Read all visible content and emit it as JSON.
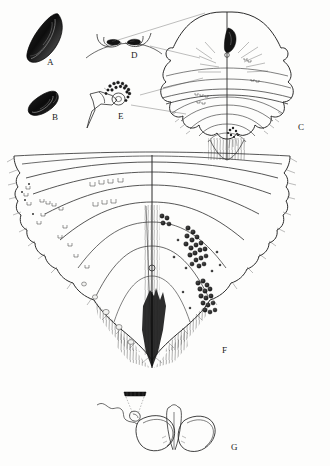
{
  "figure": {
    "background_color": "#fdfdfc",
    "ink_color": "#2b2b2b",
    "panels": [
      {
        "id": "A",
        "label": "A",
        "label_x": 47,
        "label_y": 63,
        "description": "dark elongate sclerotized body, oblique, whole specimen lateral",
        "kind": "solid-dark-elongate"
      },
      {
        "id": "B",
        "label": "B",
        "label_x": 52,
        "label_y": 118,
        "description": "smaller dark elongate body, oblique, whole specimen",
        "kind": "solid-dark-elongate"
      },
      {
        "id": "C",
        "label": "C",
        "label_x": 298,
        "label_y": 128,
        "description": "dorsal view of body with median line, lobed margins and radiating striations",
        "kind": "outline-body-dorsal"
      },
      {
        "id": "D",
        "label": "D",
        "label_x": 131,
        "label_y": 56,
        "description": "paired hook-like marginal structures on cuticle arc, enlarged detail",
        "kind": "detail-paired-hooks"
      },
      {
        "id": "E",
        "label": "E",
        "label_x": 118,
        "label_y": 117,
        "description": "stalked cup-shaped organ with rosette of granules, enlarged detail",
        "kind": "detail-stalked-organ"
      },
      {
        "id": "F",
        "label": "F",
        "label_x": 222,
        "label_y": 351,
        "description": "ventral abdominal plate, median line, concentric ridges, bracket setae on left, dot clusters on right, dense marginal pile",
        "kind": "outline-body-ventral"
      },
      {
        "id": "G",
        "label": "G",
        "label_x": 231,
        "label_y": 448,
        "description": "paired looped genitalic sclerites with median rod and attached filament, with inset bar detail",
        "kind": "outline-genitalia"
      }
    ],
    "leader_lines": [
      {
        "from_panel": "D",
        "to_panel": "C"
      },
      {
        "from_panel": "E",
        "to_panel": "C"
      },
      {
        "from_panel": "D",
        "to_panel": "C"
      }
    ],
    "markings": {
      "bracket_setae_side": "left",
      "bracket_setae_count": 22,
      "dot_cluster_side": "right",
      "dot_count": 46,
      "dot_color": "#2a2a2a"
    }
  }
}
